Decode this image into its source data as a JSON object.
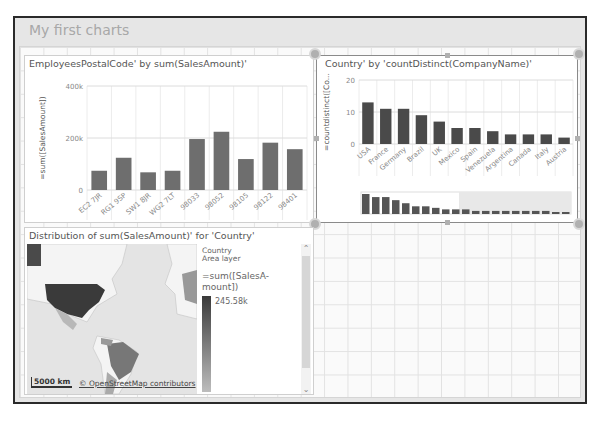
{
  "sheet": {
    "title": "My first charts"
  },
  "panels": {
    "bar_postal": {
      "title": "EmployeesPostalCode' by sum(SalesAmount)'",
      "ylabel": "=sum([SalesAmount])"
    },
    "bar_country": {
      "title": "Country' by 'countDistinct(CompanyName)'",
      "ylabel": "=countdistinct([Co..."
    },
    "map": {
      "title": "Distribution of sum(SalesAmount)' for 'Country'",
      "legend_layer": "Country",
      "legend_layer_type": "Area layer",
      "legend_measure": "=sum([SalesA-mount])",
      "legend_max": "245.58k",
      "scale_label": "5000 km",
      "attribution": "© OpenStreetMap contributors",
      "colors": {
        "max": "#3a3a3a",
        "mid": "#777777",
        "low": "#b8b8b8",
        "land": "#f4f4f4",
        "water": "#e2e2e2"
      }
    }
  },
  "chart_data": [
    {
      "type": "bar",
      "title": "EmployeesPostalCode' by sum(SalesAmount)'",
      "xlabel": "",
      "ylabel": "=sum([SalesAmount])",
      "categories": [
        "EC2 7JR",
        "RG1 9SP",
        "SW1 8JR",
        "WG2 7LT",
        "98033",
        "98052",
        "98105",
        "98122",
        "98401"
      ],
      "values": [
        74000,
        124000,
        68000,
        74000,
        196000,
        224000,
        119000,
        182000,
        157000
      ],
      "yticks": [
        0,
        200000,
        400000
      ],
      "ytick_labels": [
        "0",
        "200k",
        "400k"
      ],
      "ylim": [
        0,
        400000
      ],
      "grid": true,
      "color": "#6e6e6e"
    },
    {
      "type": "bar",
      "title": "Country' by 'countDistinct(CompanyName)'",
      "xlabel": "",
      "ylabel": "=countdistinct([Co...",
      "categories": [
        "USA",
        "France",
        "Germany",
        "Brazil",
        "UK",
        "Mexico",
        "Spain",
        "Venezuela",
        "Argentina",
        "Canada",
        "Italy",
        "Austria"
      ],
      "values": [
        13,
        11,
        11,
        9,
        7,
        5,
        5,
        4,
        3,
        3,
        3,
        2
      ],
      "yticks": [
        0,
        10,
        20
      ],
      "ytick_labels": [
        "0",
        "10",
        "20"
      ],
      "ylim": [
        0,
        20
      ],
      "grid": true,
      "color": "#4a4a4a",
      "minimap_values": [
        13,
        11,
        11,
        9,
        7,
        5,
        5,
        4,
        3,
        3,
        3,
        2,
        2,
        2,
        2,
        2,
        2,
        2,
        2,
        1,
        1
      ]
    }
  ]
}
